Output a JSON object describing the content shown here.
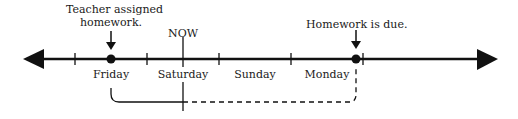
{
  "diagram": {
    "type": "number-line timeline",
    "annotations": {
      "assigned": "Teacher assigned homework.",
      "assigned_line1": "Teacher assigned",
      "assigned_line2": "homework.",
      "now": "NOW",
      "due": "Homework is due."
    },
    "days": [
      "Friday",
      "Saturday",
      "Sunday",
      "Monday"
    ],
    "colors": {
      "line": "#111111",
      "text": "#1a1a1a",
      "background": "#ffffff"
    }
  }
}
